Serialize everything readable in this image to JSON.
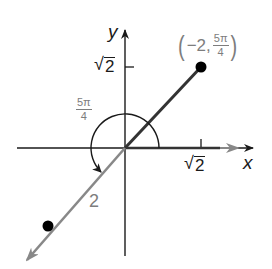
{
  "figure": {
    "axes": {
      "x_label": "x",
      "y_label": "y",
      "x_tick_label": {
        "radical": "√",
        "value": "2"
      },
      "y_tick_label": {
        "radical": "√",
        "value": "2"
      }
    },
    "point": {
      "label_open": "(",
      "r": "−2,",
      "theta_num": "5π",
      "theta_den": "4",
      "label_close": ")"
    },
    "angle_label": {
      "num": "5π",
      "den": "4"
    },
    "distance_label": "2",
    "colors": {
      "axis": "#1a1a1a",
      "terminal_ray": "#333333",
      "negative_ray": "#888888",
      "label_gray": "#7d7d7d",
      "point": "#000000"
    }
  }
}
